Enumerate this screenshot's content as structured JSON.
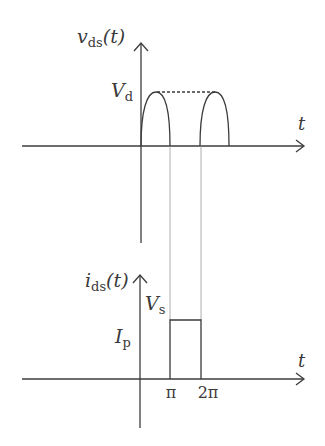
{
  "upper_plot": {
    "y_label_main": "v",
    "y_label_sub": "ds",
    "y_label_arg": "(t)",
    "x_label": "t",
    "level_label_main": "V",
    "level_label_sub": "d",
    "waveform": "half-sine arches with dashed line at peak"
  },
  "lower_plot": {
    "y_label_main": "i",
    "y_label_sub": "ds",
    "y_label_arg": "(t)",
    "x_label": "t",
    "pulse_label_main": "V",
    "pulse_label_sub": "s",
    "level_label_main": "I",
    "level_label_sub": "p",
    "waveform": "rectangular pulse from π to 2π",
    "ticks": [
      "π",
      "2π"
    ]
  },
  "colors": {
    "line": "#3a3a3a",
    "guide": "#9a9a9a",
    "background": "#ffffff"
  }
}
